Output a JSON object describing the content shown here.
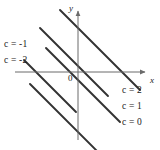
{
  "figure": {
    "type": "contour-plot",
    "background_color": "#ffffff",
    "line_color": "#333333",
    "axis_color": "#6b6b6b",
    "text_color": "#1a1a1a"
  },
  "axes": {
    "x_label": "x",
    "y_label": "y",
    "origin_label": "0",
    "x_axis_y_px": 72,
    "y_axis_x_px": 78,
    "x_axis_start_px": 15,
    "x_axis_end_px": 148,
    "y_axis_start_px": 8,
    "y_axis_end_px": 140
  },
  "chart_data": {
    "type": "line",
    "title": "",
    "xlabel": "x",
    "ylabel": "y",
    "grid": false,
    "legend": "inline-labels",
    "slope": -1,
    "series": [
      {
        "name": "c = -2",
        "label": "c = -2",
        "c_value": -2,
        "label_side": "left",
        "label_x": 4,
        "label_y": 56,
        "x1": 24,
        "y1": 60,
        "x2": 76,
        "y2": 112
      },
      {
        "name": "c = -1",
        "label": "c = -1",
        "c_value": -1,
        "label_side": "left",
        "label_x": 4,
        "label_y": 40,
        "x1": 40,
        "y1": 28,
        "x2": 108,
        "y2": 96
      },
      {
        "name": "c = 0",
        "label": "c = 0",
        "c_value": 0,
        "label_side": "right",
        "label_x": 122,
        "label_y": 118,
        "x1": 60,
        "y1": 10,
        "x2": 140,
        "y2": 90
      },
      {
        "name": "c = 1",
        "label": "c = 1",
        "c_value": 1,
        "label_side": "right",
        "label_x": 122,
        "label_y": 102,
        "x1": 46,
        "y1": 48,
        "x2": 120,
        "y2": 122
      },
      {
        "name": "c = 2",
        "label": "c = 2",
        "c_value": 2,
        "label_side": "right",
        "label_x": 122,
        "label_y": 86,
        "x1": 30,
        "y1": 84,
        "x2": 100,
        "y2": 154
      }
    ],
    "level_labels": [
      "c = -2",
      "c = -1",
      "c = 0",
      "c = 1",
      "c = 2"
    ],
    "level_values": [
      -2,
      -1,
      0,
      1,
      2
    ]
  }
}
